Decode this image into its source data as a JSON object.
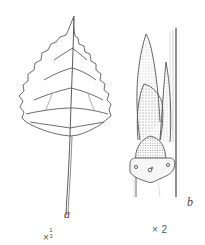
{
  "figure": {
    "panels": [
      {
        "id": "a",
        "label": "a",
        "description": "triangular serrated leaf with long petiole",
        "scale_prefix": "×",
        "scale_num": "1",
        "scale_den": "3"
      },
      {
        "id": "b",
        "label": "b",
        "description": "pointed scaly bud on twig with leaf scar",
        "scale": "× 2"
      }
    ],
    "colors": {
      "line": "#555555",
      "background": "#ffffff",
      "shade": "#8a8a8a"
    }
  }
}
